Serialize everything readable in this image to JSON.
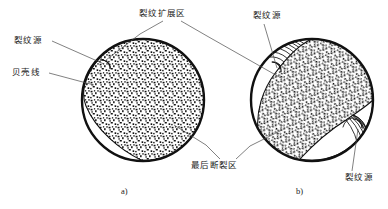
{
  "figure": {
    "labels": {
      "crack_origin_left": "裂纹源",
      "shell_lines": "贝壳线",
      "propagation_zone": "裂纹扩展区",
      "crack_origin_top_right": "裂纹源",
      "final_fracture_zone": "最后断裂区",
      "crack_origin_bottom_right": "裂纹源"
    },
    "captions": {
      "a": "a)",
      "b": "b)"
    },
    "colors": {
      "stroke": "#111111",
      "background": "#ffffff",
      "leader_line": "#4a4a4a",
      "text": "#1a1a1a"
    }
  },
  "diagram_data": {
    "type": "technical-illustration",
    "subject": "fatigue fracture surface morphology",
    "panels": [
      {
        "caption": "a)",
        "circle": {
          "cx": 143,
          "cy": 100,
          "r": 62
        },
        "regions": [
          {
            "name": "crack-origin",
            "count": 1,
            "position": "upper-left",
            "label": "裂纹源"
          },
          {
            "name": "beach-marks",
            "pattern": "concentric-arcs",
            "arc_count": 13,
            "label": "贝壳线"
          },
          {
            "name": "propagation-zone",
            "pattern": "concentric-arcs",
            "label": "裂纹扩展区"
          },
          {
            "name": "final-fracture-zone",
            "pattern": "stipple",
            "position": "right-and-bottom",
            "label": "最后断裂区"
          }
        ]
      },
      {
        "caption": "b)",
        "circle": {
          "cx": 312,
          "cy": 100,
          "r": 62
        },
        "regions": [
          {
            "name": "crack-origin",
            "count": 2,
            "position": "upper-left and lower-right",
            "label": "裂纹源"
          },
          {
            "name": "beach-marks",
            "pattern": "concentric-arcs",
            "arc_count": 9,
            "label": "贝壳线"
          },
          {
            "name": "propagation-zone",
            "pattern": "concentric-arcs",
            "label": "裂纹扩展区"
          },
          {
            "name": "final-fracture-zone",
            "pattern": "stipple",
            "position": "diagonal-band-center",
            "label": "最后断裂区"
          }
        ]
      }
    ]
  }
}
